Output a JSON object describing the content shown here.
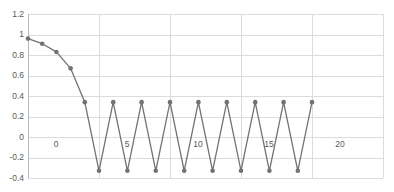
{
  "chart_data": {
    "type": "line",
    "title": "",
    "subtitle": "",
    "xlabel": "",
    "ylabel": "",
    "xlim": [
      0,
      25
    ],
    "ylim": [
      -0.4,
      1.2
    ],
    "grid": true,
    "legend": false,
    "legend_position": "none",
    "x_ticks": [
      0,
      5,
      10,
      15,
      20,
      25
    ],
    "x_tick_labels": [
      "0",
      "5",
      "10",
      "15",
      "20",
      "25"
    ],
    "y_ticks": [
      -0.4,
      -0.2,
      0,
      0.2,
      0.4,
      0.6,
      0.8,
      1,
      1.2
    ],
    "y_tick_labels": [
      "-0.4",
      "-0.2",
      "0",
      "0.2",
      "0.4",
      "0.6",
      "0.8",
      "1",
      "1.2"
    ],
    "markers": true,
    "marker_shape": "circle",
    "series": [
      {
        "name": "series-1",
        "color": "#767171",
        "x": [
          0,
          1,
          2,
          3,
          4,
          5,
          6,
          7,
          8,
          9,
          10,
          11,
          12,
          13,
          14,
          15,
          16,
          17,
          18,
          19,
          20
        ],
        "values": [
          0.96,
          0.91,
          0.83,
          0.67,
          0.34,
          -0.33,
          0.34,
          -0.33,
          0.34,
          -0.33,
          0.34,
          -0.33,
          0.34,
          -0.33,
          0.34,
          -0.33,
          0.34,
          -0.33,
          0.34,
          -0.33,
          0.34
        ]
      }
    ]
  },
  "style": {
    "line_color": "#767171",
    "marker_color": "#767171",
    "grid_color": "#dcdcdc",
    "axis_color": "#b9b9b9",
    "tick_text_color": "#595959",
    "background": "#ffffff"
  }
}
